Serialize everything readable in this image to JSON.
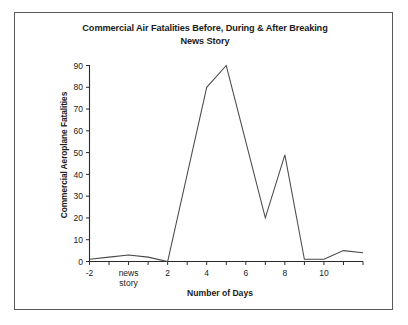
{
  "frame": {
    "border_color": "#58585a",
    "background": "#ffffff"
  },
  "chart_data": {
    "type": "line",
    "title": "Commercial Air Fatalities Before, During & After Breaking News Story",
    "title_line1": "Commercial Air Fatalities Before, During & After Breaking",
    "title_line2": "News Story",
    "xlabel": "Number of Days",
    "ylabel": "Commercial Aeroplane Fatalities",
    "xlim": [
      -2,
      12
    ],
    "ylim": [
      0,
      90
    ],
    "grid": false,
    "legend": false,
    "line_color": "#4a4a4a",
    "x_tick_labels": [
      "-2",
      "2",
      "4",
      "6",
      "8",
      "10"
    ],
    "x_tick_values": [
      -2,
      2,
      4,
      6,
      8,
      10
    ],
    "x_minor_ticks": [
      -2,
      -1,
      0,
      1,
      2,
      3,
      4,
      5,
      6,
      7,
      8,
      9,
      10,
      11,
      12
    ],
    "y_tick_labels": [
      "0",
      "10",
      "20",
      "30",
      "40",
      "50",
      "60",
      "70",
      "80",
      "90"
    ],
    "y_tick_values": [
      0,
      10,
      20,
      30,
      40,
      50,
      60,
      70,
      80,
      90
    ],
    "event_annotation": {
      "label_line1": "news",
      "label_line2": "story",
      "x": 0
    },
    "x": [
      -2,
      -1,
      0,
      1,
      2,
      3,
      4,
      5,
      6,
      7,
      8,
      9,
      10,
      11,
      12
    ],
    "values": [
      1,
      2,
      3,
      2,
      0,
      40,
      80,
      90,
      55,
      20,
      49,
      1,
      1,
      5,
      4
    ],
    "series": [
      {
        "name": "Commercial Aeroplane Fatalities",
        "values": [
          1,
          2,
          3,
          2,
          0,
          40,
          80,
          90,
          55,
          20,
          49,
          1,
          1,
          5,
          4
        ]
      }
    ]
  }
}
